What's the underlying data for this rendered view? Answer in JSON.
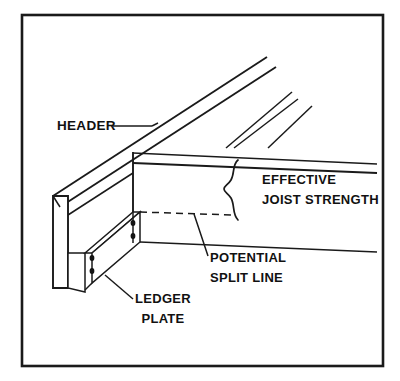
{
  "figure": {
    "type": "technical-line-drawing",
    "background_color": "#ffffff",
    "line_color": "#1a1a1a",
    "border": {
      "present": true,
      "style": "solid rectangle",
      "x": 22,
      "y": 15,
      "width": 361,
      "height": 351
    }
  },
  "labels": {
    "header": {
      "text": "HEADER",
      "x": 57,
      "y": 130,
      "anchor": "start",
      "leader": "horizontal dash to header beam"
    },
    "effective_joist_strength": {
      "line1": "EFFECTIVE",
      "line2": "JOIST STRENGTH",
      "x": 262,
      "y1": 184,
      "y2": 204,
      "anchor": "start",
      "annotation": "curly brace spanning joist depth"
    },
    "potential_split_line": {
      "line1": "POTENTIAL",
      "line2": "SPLIT LINE",
      "x": 210,
      "y1": 262,
      "y2": 282,
      "anchor": "start",
      "leader": "diagonal to dashed split line"
    },
    "ledger_plate": {
      "line1": "LEDGER",
      "line2": "PLATE",
      "x": 163,
      "y1": 303,
      "y2": 323,
      "anchor": "middle",
      "leader": "diagonal to ledger plate"
    }
  },
  "components": {
    "header_beam": {
      "name": "header beam",
      "description": "long diagonal beam running from lower-left to upper-right"
    },
    "joist_faces": {
      "name": "joist end faces",
      "description": "parallel diagonal joist lines at upper right"
    },
    "ledger_plate_member": {
      "name": "ledger plate",
      "description": "horizontal nailed plate below header",
      "nail_count": 4
    },
    "split_line": {
      "name": "potential split line",
      "style": "dashed"
    }
  },
  "colors": {
    "ink": "#1a1a1a",
    "paper": "#ffffff",
    "nail": "#141414"
  }
}
